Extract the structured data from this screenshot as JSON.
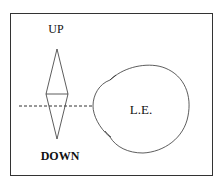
{
  "diagram": {
    "labels": {
      "up": "UP",
      "down": "DOWN",
      "eye": "L.E."
    },
    "colors": {
      "stroke": "#333333",
      "text": "#111111",
      "background": "#ffffff"
    }
  }
}
